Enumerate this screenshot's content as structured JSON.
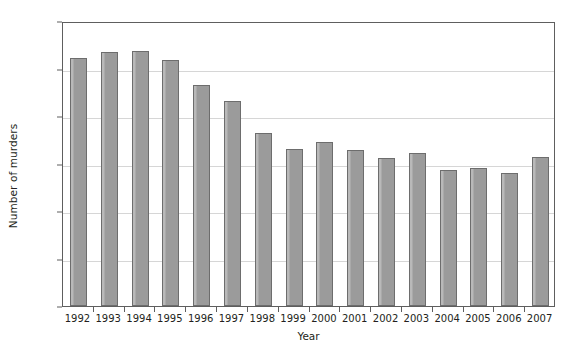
{
  "chart_data": {
    "type": "bar",
    "title": "",
    "xlabel": "Year",
    "ylabel": "Number of murders",
    "categories": [
      "1992",
      "1993",
      "1994",
      "1995",
      "1996",
      "1997",
      "1998",
      "1999",
      "2000",
      "2001",
      "2002",
      "2003",
      "2004",
      "2005",
      "2006",
      "2007"
    ],
    "values": [
      1045,
      1070,
      1075,
      1035,
      930,
      865,
      730,
      660,
      690,
      655,
      625,
      645,
      572,
      583,
      560,
      628
    ],
    "ylim": [
      0,
      1200
    ],
    "ytick_labels": [
      "0",
      "200",
      "400",
      "600",
      "800",
      "1000",
      "1200"
    ],
    "ytick_values": [
      0,
      200,
      400,
      600,
      800,
      1000,
      1200
    ],
    "gridlines": true,
    "gridline_values": [
      200,
      400,
      600,
      800,
      1000
    ],
    "legend": null,
    "legend_position": "none",
    "series": [
      {
        "name": "Number of murders",
        "values": [
          1045,
          1070,
          1075,
          1035,
          930,
          865,
          730,
          660,
          690,
          655,
          625,
          645,
          572,
          583,
          560,
          628
        ]
      }
    ]
  },
  "colors": {
    "bar_fill": "#9b9b9b",
    "bar_edge": "#6d6d6d",
    "gridline": "#d6d6d6",
    "axis": "#5e5e5e",
    "text": "#231f20",
    "background": "#ffffff"
  }
}
